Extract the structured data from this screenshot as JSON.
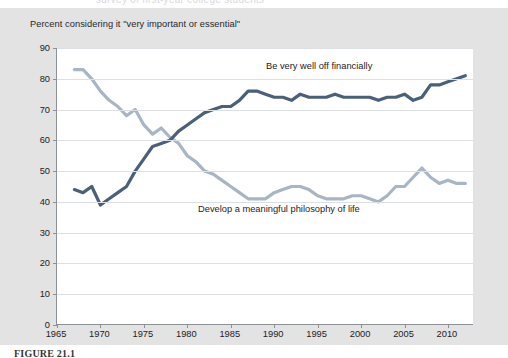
{
  "page": {
    "top_cutoff_text": "survey of first-year college students",
    "figure_caption": "FIGURE 21.1"
  },
  "chart_data": {
    "type": "line",
    "title": "Percent considering it \"very important or essential\"",
    "subtitle": "",
    "xlabel": "",
    "ylabel": "",
    "xlim": [
      1965,
      2013
    ],
    "ylim": [
      0,
      90
    ],
    "ytick_step": 10,
    "xtick_step": 5,
    "grid": true,
    "legend_position": "inline-annotation",
    "yticks": [
      0,
      10,
      20,
      30,
      40,
      50,
      60,
      70,
      80,
      90
    ],
    "xticks": [
      1965,
      1970,
      1975,
      1980,
      1985,
      1990,
      1995,
      2000,
      2005,
      2010
    ],
    "colors": {
      "be_very_well_off_financially": "#4a5f7a",
      "develop_a_meaningful_philosophy_of_life": "#a8b5c4",
      "gridline": "#dcdfe3",
      "axis": "#8d9299",
      "plot_background": "#ffffff",
      "page_background": "#e3e3e3",
      "text": "#1e2124"
    },
    "annotations": [
      {
        "text": "Be very well off financially",
        "x": 1993,
        "y": 85
      },
      {
        "text": "Develop a meaningful philosophy of life",
        "x": 1987,
        "y": 38
      }
    ],
    "series": [
      {
        "name": "Be very well off financially",
        "color": "#4a5f7a",
        "x": [
          1967,
          1968,
          1969,
          1970,
          1971,
          1972,
          1973,
          1974,
          1975,
          1976,
          1977,
          1978,
          1979,
          1980,
          1981,
          1982,
          1983,
          1984,
          1985,
          1986,
          1987,
          1988,
          1989,
          1990,
          1991,
          1992,
          1993,
          1994,
          1995,
          1996,
          1997,
          1998,
          1999,
          2000,
          2001,
          2002,
          2003,
          2004,
          2005,
          2006,
          2007,
          2008,
          2009,
          2010,
          2011,
          2012
        ],
        "values": [
          44,
          43,
          45,
          39,
          41,
          43,
          45,
          50,
          54,
          58,
          59,
          60,
          63,
          65,
          67,
          69,
          70,
          71,
          71,
          73,
          76,
          76,
          75,
          74,
          74,
          73,
          75,
          74,
          74,
          74,
          75,
          74,
          74,
          74,
          74,
          73,
          74,
          74,
          75,
          73,
          74,
          78,
          78,
          79,
          80,
          81
        ]
      },
      {
        "name": "Develop a meaningful philosophy of life",
        "color": "#a8b5c4",
        "x": [
          1967,
          1968,
          1969,
          1970,
          1971,
          1972,
          1973,
          1974,
          1975,
          1976,
          1977,
          1978,
          1979,
          1980,
          1981,
          1982,
          1983,
          1984,
          1985,
          1986,
          1987,
          1988,
          1989,
          1990,
          1991,
          1992,
          1993,
          1994,
          1995,
          1996,
          1997,
          1998,
          1999,
          2000,
          2001,
          2002,
          2003,
          2004,
          2005,
          2006,
          2007,
          2008,
          2009,
          2010,
          2011,
          2012
        ],
        "values": [
          83,
          83,
          80,
          76,
          73,
          71,
          68,
          70,
          65,
          62,
          64,
          61,
          59,
          55,
          53,
          50,
          49,
          47,
          45,
          43,
          41,
          41,
          41,
          43,
          44,
          45,
          45,
          44,
          42,
          41,
          41,
          41,
          42,
          42,
          41,
          40,
          42,
          45,
          45,
          48,
          51,
          48,
          46,
          47,
          46,
          46
        ]
      }
    ]
  }
}
